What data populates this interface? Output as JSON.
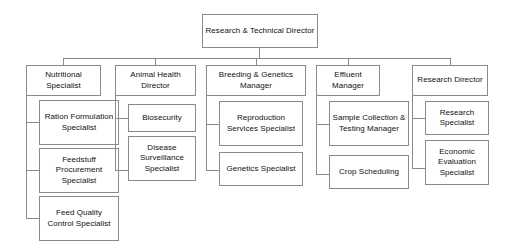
{
  "chart_title": "Research & Technical Director Organizational Chart",
  "root": {
    "label": "Research & Technical Director"
  },
  "departments": [
    {
      "label": "Nutritional Specialist",
      "children": [
        {
          "label": "Ration Formulation Specialist"
        },
        {
          "label": "Feedstuff Procurement Specialist"
        },
        {
          "label": "Feed Quality Control Specialist"
        }
      ]
    },
    {
      "label": "Animal Health Director",
      "children": [
        {
          "label": "Biosecurity"
        },
        {
          "label": "Disease Surveillance Specialist"
        }
      ]
    },
    {
      "label": "Breeding & Genetics Manager",
      "children": [
        {
          "label": "Reproduction Services Specialist"
        },
        {
          "label": "Genetics Specialist"
        }
      ]
    },
    {
      "label": "Effluent Manager",
      "children": [
        {
          "label": "Sample Collection & Testing Manager"
        },
        {
          "label": "Crop Scheduling"
        }
      ]
    },
    {
      "label": "Research Director",
      "children": [
        {
          "label": "Research Specialist"
        },
        {
          "label": "Economic Evaluation Specialist"
        }
      ]
    }
  ],
  "style": {
    "border_color": "#8a8a8a",
    "text_color": "#111111",
    "background_color": "#ffffff",
    "connector_color": "#8a8a8a"
  }
}
